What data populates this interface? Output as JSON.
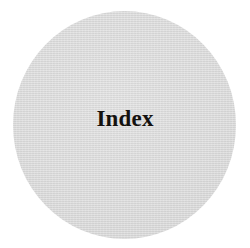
{
  "page": {
    "background_color": "#ffffff",
    "width": 250,
    "height": 248
  },
  "disc": {
    "name": "index-disc",
    "shape": "circle",
    "fill_color": "#d6d6d6",
    "diameter_px": 223
  },
  "label": {
    "text": "Index",
    "color": "#15120f",
    "weight": "bold",
    "style": "serif"
  }
}
